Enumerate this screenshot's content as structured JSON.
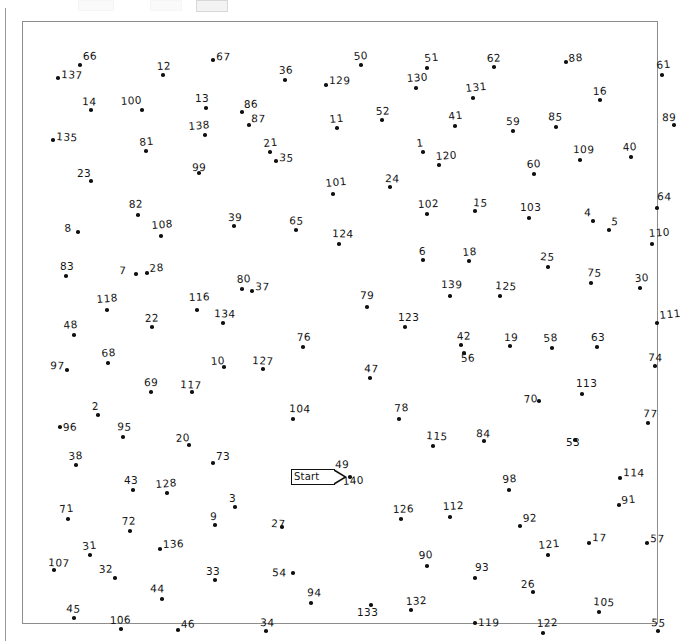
{
  "app": {
    "kind": "connect-the-dots-puzzle",
    "frame_border_color": "#8d8d8d",
    "dot_color": "#111111",
    "label_color": "#141414"
  },
  "start_marker": {
    "label": "Start",
    "x": 268,
    "y": 447,
    "points_to_dot": "49"
  },
  "puzzle": {
    "total_dots": 140,
    "dots": [
      {
        "n": "1",
        "dx": 400,
        "dy": 130,
        "lx": 394,
        "ly": 127
      },
      {
        "n": "2",
        "dx": 75,
        "dy": 393,
        "lx": 69,
        "ly": 390
      },
      {
        "n": "3",
        "dx": 212,
        "dy": 485,
        "lx": 206,
        "ly": 482
      },
      {
        "n": "4",
        "dx": 570,
        "dy": 199,
        "lx": 561,
        "ly": 196
      },
      {
        "n": "5",
        "dx": 586,
        "dy": 208,
        "lx": 588,
        "ly": 205
      },
      {
        "n": "6",
        "dx": 400,
        "dy": 238,
        "lx": 396,
        "ly": 235
      },
      {
        "n": "7",
        "dx": 113,
        "dy": 252,
        "lx": 96,
        "ly": 254
      },
      {
        "n": "8",
        "dx": 55,
        "dy": 210,
        "lx": 42,
        "ly": 212
      },
      {
        "n": "9",
        "dx": 192,
        "dy": 503,
        "lx": 187,
        "ly": 500
      },
      {
        "n": "10",
        "dx": 201,
        "dy": 345,
        "lx": 188,
        "ly": 345
      },
      {
        "n": "11",
        "dx": 314,
        "dy": 106,
        "lx": 307,
        "ly": 103
      },
      {
        "n": "12",
        "dx": 140,
        "dy": 53,
        "lx": 134,
        "ly": 50
      },
      {
        "n": "13",
        "dx": 183,
        "dy": 86,
        "lx": 172,
        "ly": 82
      },
      {
        "n": "14",
        "dx": 68,
        "dy": 88,
        "lx": 59,
        "ly": 85
      },
      {
        "n": "15",
        "dx": 452,
        "dy": 189,
        "lx": 450,
        "ly": 186
      },
      {
        "n": "16",
        "dx": 577,
        "dy": 78,
        "lx": 570,
        "ly": 75
      },
      {
        "n": "17",
        "dx": 566,
        "dy": 521,
        "lx": 569,
        "ly": 521
      },
      {
        "n": "18",
        "dx": 446,
        "dy": 239,
        "lx": 440,
        "ly": 236
      },
      {
        "n": "19",
        "dx": 487,
        "dy": 324,
        "lx": 481,
        "ly": 321
      },
      {
        "n": "20",
        "dx": 166,
        "dy": 423,
        "lx": 153,
        "ly": 422
      },
      {
        "n": "21",
        "dx": 247,
        "dy": 130,
        "lx": 241,
        "ly": 127
      },
      {
        "n": "22",
        "dx": 129,
        "dy": 305,
        "lx": 122,
        "ly": 302
      },
      {
        "n": "23",
        "dx": 68,
        "dy": 159,
        "lx": 54,
        "ly": 157
      },
      {
        "n": "24",
        "dx": 367,
        "dy": 165,
        "lx": 362,
        "ly": 162
      },
      {
        "n": "25",
        "dx": 525,
        "dy": 245,
        "lx": 517,
        "ly": 240
      },
      {
        "n": "26",
        "dx": 510,
        "dy": 570,
        "lx": 498,
        "ly": 568
      },
      {
        "n": "27",
        "dx": 259,
        "dy": 505,
        "lx": 248,
        "ly": 507
      },
      {
        "n": "28",
        "dx": 124,
        "dy": 251,
        "lx": 127,
        "ly": 252
      },
      {
        "n": "29",
        "dx": 0,
        "dy": 0,
        "lx": 0,
        "ly": 0
      },
      {
        "n": "30",
        "dx": 617,
        "dy": 266,
        "lx": 612,
        "ly": 262
      },
      {
        "n": "31",
        "dx": 67,
        "dy": 533,
        "lx": 60,
        "ly": 530
      },
      {
        "n": "32",
        "dx": 92,
        "dy": 556,
        "lx": 76,
        "ly": 553
      },
      {
        "n": "33",
        "dx": 192,
        "dy": 558,
        "lx": 183,
        "ly": 555
      },
      {
        "n": "34",
        "dx": 243,
        "dy": 609,
        "lx": 237,
        "ly": 606
      },
      {
        "n": "35",
        "dx": 253,
        "dy": 139,
        "lx": 256,
        "ly": 141
      },
      {
        "n": "36",
        "dx": 262,
        "dy": 58,
        "lx": 256,
        "ly": 54
      },
      {
        "n": "37",
        "dx": 229,
        "dy": 269,
        "lx": 232,
        "ly": 270
      },
      {
        "n": "38",
        "dx": 53,
        "dy": 443,
        "lx": 46,
        "ly": 440
      },
      {
        "n": "39",
        "dx": 211,
        "dy": 204,
        "lx": 205,
        "ly": 201
      },
      {
        "n": "40",
        "dx": 608,
        "dy": 135,
        "lx": 600,
        "ly": 131
      },
      {
        "n": "41",
        "dx": 432,
        "dy": 104,
        "lx": 426,
        "ly": 100
      },
      {
        "n": "42",
        "dx": 438,
        "dy": 323,
        "lx": 434,
        "ly": 320
      },
      {
        "n": "43",
        "dx": 110,
        "dy": 468,
        "lx": 101,
        "ly": 464
      },
      {
        "n": "44",
        "dx": 139,
        "dy": 577,
        "lx": 127,
        "ly": 572
      },
      {
        "n": "45",
        "dx": 51,
        "dy": 596,
        "lx": 43,
        "ly": 592
      },
      {
        "n": "46",
        "dx": 155,
        "dy": 608,
        "lx": 158,
        "ly": 608
      },
      {
        "n": "47",
        "dx": 347,
        "dy": 356,
        "lx": 341,
        "ly": 352
      },
      {
        "n": "48",
        "dx": 51,
        "dy": 313,
        "lx": 41,
        "ly": 309
      },
      {
        "n": "49",
        "dx": 315,
        "dy": 453,
        "lx": 312,
        "ly": 448
      },
      {
        "n": "50",
        "dx": 338,
        "dy": 43,
        "lx": 331,
        "ly": 40
      },
      {
        "n": "51",
        "dx": 404,
        "dy": 46,
        "lx": 402,
        "ly": 42
      },
      {
        "n": "52",
        "dx": 359,
        "dy": 98,
        "lx": 353,
        "ly": 95
      },
      {
        "n": "53",
        "dx": 552,
        "dy": 418,
        "lx": 543,
        "ly": 426
      },
      {
        "n": "54",
        "dx": 270,
        "dy": 551,
        "lx": 249,
        "ly": 556
      },
      {
        "n": "55",
        "dx": 635,
        "dy": 609,
        "lx": 628,
        "ly": 606
      },
      {
        "n": "56",
        "dx": 441,
        "dy": 331,
        "lx": 438,
        "ly": 342
      },
      {
        "n": "57",
        "dx": 624,
        "dy": 521,
        "lx": 627,
        "ly": 522
      },
      {
        "n": "58",
        "dx": 529,
        "dy": 326,
        "lx": 521,
        "ly": 322
      },
      {
        "n": "59",
        "dx": 490,
        "dy": 109,
        "lx": 483,
        "ly": 105
      },
      {
        "n": "60",
        "dx": 511,
        "dy": 152,
        "lx": 504,
        "ly": 148
      },
      {
        "n": "61",
        "dx": 639,
        "dy": 53,
        "lx": 634,
        "ly": 49
      },
      {
        "n": "62",
        "dx": 471,
        "dy": 45,
        "lx": 464,
        "ly": 42
      },
      {
        "n": "63",
        "dx": 574,
        "dy": 325,
        "lx": 568,
        "ly": 321
      },
      {
        "n": "64",
        "dx": 634,
        "dy": 186,
        "lx": 634,
        "ly": 180
      },
      {
        "n": "65",
        "dx": 273,
        "dy": 208,
        "lx": 266,
        "ly": 204
      },
      {
        "n": "66",
        "dx": 57,
        "dy": 43,
        "lx": 60,
        "ly": 40
      },
      {
        "n": "67",
        "dx": 190,
        "dy": 38,
        "lx": 193,
        "ly": 40
      },
      {
        "n": "68",
        "dx": 85,
        "dy": 341,
        "lx": 79,
        "ly": 337
      },
      {
        "n": "69",
        "dx": 128,
        "dy": 370,
        "lx": 121,
        "ly": 366
      },
      {
        "n": "70",
        "dx": 516,
        "dy": 379,
        "lx": 501,
        "ly": 383
      },
      {
        "n": "71",
        "dx": 45,
        "dy": 497,
        "lx": 37,
        "ly": 493
      },
      {
        "n": "72",
        "dx": 107,
        "dy": 509,
        "lx": 99,
        "ly": 505
      },
      {
        "n": "73",
        "dx": 190,
        "dy": 441,
        "lx": 193,
        "ly": 440
      },
      {
        "n": "74",
        "dx": 632,
        "dy": 344,
        "lx": 625,
        "ly": 341
      },
      {
        "n": "75",
        "dx": 568,
        "dy": 261,
        "lx": 564,
        "ly": 256
      },
      {
        "n": "76",
        "dx": 280,
        "dy": 325,
        "lx": 274,
        "ly": 321
      },
      {
        "n": "77",
        "dx": 625,
        "dy": 401,
        "lx": 620,
        "ly": 397
      },
      {
        "n": "78",
        "dx": 376,
        "dy": 397,
        "lx": 372,
        "ly": 392
      },
      {
        "n": "79",
        "dx": 344,
        "dy": 285,
        "lx": 337,
        "ly": 279
      },
      {
        "n": "80",
        "dx": 219,
        "dy": 267,
        "lx": 214,
        "ly": 263
      },
      {
        "n": "81",
        "dx": 123,
        "dy": 129,
        "lx": 117,
        "ly": 126
      },
      {
        "n": "82",
        "dx": 115,
        "dy": 193,
        "lx": 106,
        "ly": 188
      },
      {
        "n": "83",
        "dx": 43,
        "dy": 254,
        "lx": 37,
        "ly": 250
      },
      {
        "n": "84",
        "dx": 461,
        "dy": 419,
        "lx": 453,
        "ly": 417
      },
      {
        "n": "85",
        "dx": 533,
        "dy": 105,
        "lx": 525,
        "ly": 100
      },
      {
        "n": "86",
        "dx": 219,
        "dy": 90,
        "lx": 221,
        "ly": 88
      },
      {
        "n": "87",
        "dx": 226,
        "dy": 103,
        "lx": 228,
        "ly": 102
      },
      {
        "n": "88",
        "dx": 543,
        "dy": 40,
        "lx": 546,
        "ly": 42
      },
      {
        "n": "89",
        "dx": 651,
        "dy": 103,
        "lx": 639,
        "ly": 101
      },
      {
        "n": "90",
        "dx": 404,
        "dy": 544,
        "lx": 396,
        "ly": 539
      },
      {
        "n": "91",
        "dx": 596,
        "dy": 483,
        "lx": 599,
        "ly": 484
      },
      {
        "n": "92",
        "dx": 497,
        "dy": 504,
        "lx": 500,
        "ly": 502
      },
      {
        "n": "93",
        "dx": 452,
        "dy": 556,
        "lx": 452,
        "ly": 551
      },
      {
        "n": "94",
        "dx": 288,
        "dy": 581,
        "lx": 284,
        "ly": 576
      },
      {
        "n": "95",
        "dx": 100,
        "dy": 415,
        "lx": 94,
        "ly": 410
      },
      {
        "n": "96",
        "dx": 37,
        "dy": 405,
        "lx": 40,
        "ly": 411
      },
      {
        "n": "97",
        "dx": 44,
        "dy": 348,
        "lx": 27,
        "ly": 349
      },
      {
        "n": "98",
        "dx": 486,
        "dy": 468,
        "lx": 480,
        "ly": 463
      },
      {
        "n": "99",
        "dx": 176,
        "dy": 151,
        "lx": 169,
        "ly": 151
      },
      {
        "n": "100",
        "dx": 119,
        "dy": 88,
        "lx": 98,
        "ly": 85
      },
      {
        "n": "101",
        "dx": 310,
        "dy": 172,
        "lx": 303,
        "ly": 167
      },
      {
        "n": "102",
        "dx": 404,
        "dy": 192,
        "lx": 395,
        "ly": 188
      },
      {
        "n": "103",
        "dx": 506,
        "dy": 196,
        "lx": 497,
        "ly": 191
      },
      {
        "n": "104",
        "dx": 270,
        "dy": 397,
        "lx": 266,
        "ly": 392
      },
      {
        "n": "105",
        "dx": 576,
        "dy": 590,
        "lx": 570,
        "ly": 585
      },
      {
        "n": "106",
        "dx": 98,
        "dy": 607,
        "lx": 87,
        "ly": 604
      },
      {
        "n": "107",
        "dx": 31,
        "dy": 548,
        "lx": 25,
        "ly": 546
      },
      {
        "n": "108",
        "dx": 138,
        "dy": 214,
        "lx": 129,
        "ly": 209
      },
      {
        "n": "109",
        "dx": 557,
        "dy": 138,
        "lx": 550,
        "ly": 133
      },
      {
        "n": "110",
        "dx": 629,
        "dy": 222,
        "lx": 626,
        "ly": 217
      },
      {
        "n": "111",
        "dx": 634,
        "dy": 301,
        "lx": 637,
        "ly": 299
      },
      {
        "n": "112",
        "dx": 427,
        "dy": 495,
        "lx": 420,
        "ly": 490
      },
      {
        "n": "113",
        "dx": 559,
        "dy": 372,
        "lx": 553,
        "ly": 367
      },
      {
        "n": "114",
        "dx": 597,
        "dy": 456,
        "lx": 600,
        "ly": 456
      },
      {
        "n": "115",
        "dx": 410,
        "dy": 424,
        "lx": 403,
        "ly": 419
      },
      {
        "n": "116",
        "dx": 174,
        "dy": 288,
        "lx": 166,
        "ly": 281
      },
      {
        "n": "117",
        "dx": 169,
        "dy": 370,
        "lx": 157,
        "ly": 368
      },
      {
        "n": "118",
        "dx": 84,
        "dy": 288,
        "lx": 74,
        "ly": 283
      },
      {
        "n": "119",
        "dx": 452,
        "dy": 601,
        "lx": 455,
        "ly": 606
      },
      {
        "n": "120",
        "dx": 416,
        "dy": 143,
        "lx": 413,
        "ly": 140
      },
      {
        "n": "121",
        "dx": 525,
        "dy": 533,
        "lx": 516,
        "ly": 529
      },
      {
        "n": "122",
        "dx": 520,
        "dy": 611,
        "lx": 514,
        "ly": 607
      },
      {
        "n": "123",
        "dx": 382,
        "dy": 305,
        "lx": 375,
        "ly": 301
      },
      {
        "n": "124",
        "dx": 316,
        "dy": 222,
        "lx": 309,
        "ly": 217
      },
      {
        "n": "125",
        "dx": 477,
        "dy": 274,
        "lx": 472,
        "ly": 269
      },
      {
        "n": "126",
        "dx": 378,
        "dy": 497,
        "lx": 370,
        "ly": 493
      },
      {
        "n": "127",
        "dx": 240,
        "dy": 347,
        "lx": 229,
        "ly": 344
      },
      {
        "n": "128",
        "dx": 144,
        "dy": 471,
        "lx": 133,
        "ly": 468
      },
      {
        "n": "129",
        "dx": 303,
        "dy": 63,
        "lx": 306,
        "ly": 64
      },
      {
        "n": "130",
        "dx": 393,
        "dy": 66,
        "lx": 384,
        "ly": 62
      },
      {
        "n": "131",
        "dx": 450,
        "dy": 76,
        "lx": 443,
        "ly": 72
      },
      {
        "n": "132",
        "dx": 388,
        "dy": 588,
        "lx": 383,
        "ly": 585
      },
      {
        "n": "133",
        "dx": 348,
        "dy": 583,
        "lx": 334,
        "ly": 596
      },
      {
        "n": "134",
        "dx": 200,
        "dy": 301,
        "lx": 191,
        "ly": 297
      },
      {
        "n": "135",
        "dx": 30,
        "dy": 118,
        "lx": 33,
        "ly": 120
      },
      {
        "n": "136",
        "dx": 137,
        "dy": 527,
        "lx": 140,
        "ly": 528
      },
      {
        "n": "137",
        "dx": 35,
        "dy": 56,
        "lx": 38,
        "ly": 58
      },
      {
        "n": "138",
        "dx": 182,
        "dy": 113,
        "lx": 166,
        "ly": 110
      },
      {
        "n": "139",
        "dx": 427,
        "dy": 274,
        "lx": 418,
        "ly": 268
      },
      {
        "n": "140",
        "dx": 327,
        "dy": 455,
        "lx": 320,
        "ly": 465
      }
    ]
  }
}
